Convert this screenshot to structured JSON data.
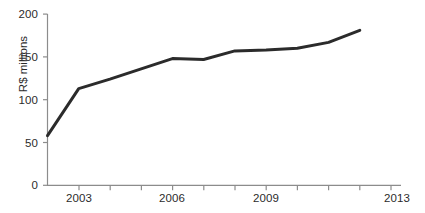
{
  "chart_data": {
    "type": "line",
    "title": "",
    "subtitle": "",
    "xlabel": "",
    "ylabel": "R$ millions",
    "x": [
      2002,
      2003,
      2004,
      2005,
      2006,
      2007,
      2008,
      2009,
      2010,
      2011,
      2012
    ],
    "values": [
      58,
      113,
      124,
      136,
      148,
      147,
      157,
      158,
      160,
      167,
      181
    ],
    "series": [
      {
        "name": "R$ millions",
        "values": [
          58,
          113,
          124,
          136,
          148,
          147,
          157,
          158,
          160,
          167,
          181
        ]
      }
    ],
    "xlim": [
      2002,
      2013
    ],
    "ylim": [
      0,
      200
    ],
    "y_ticks": [
      0,
      50,
      100,
      150,
      200
    ],
    "y_tick_labels": [
      "0",
      "50",
      "100",
      "150",
      "200"
    ],
    "x_ticks": [
      2003,
      2004,
      2005,
      2006,
      2007,
      2008,
      2009,
      2010,
      2011,
      2012,
      2013
    ],
    "x_tick_labels_visible": [
      "2003",
      "2006",
      "2009",
      "2013"
    ],
    "x_labeled_ticks": [
      2003,
      2006,
      2009,
      2013
    ],
    "grid": false,
    "legend": false,
    "legend_position": "none",
    "line_color": "#2b2b2b",
    "line_width": 3,
    "axis_color": "#8c8c8c",
    "background": "#ffffff"
  },
  "axes": {
    "y_title": "R$ millions",
    "y_labels": {
      "t0": "0",
      "t50": "50",
      "t100": "100",
      "t150": "150",
      "t200": "200"
    },
    "x_labels": {
      "a": "2003",
      "b": "2006",
      "c": "2009",
      "d": "2013"
    }
  }
}
